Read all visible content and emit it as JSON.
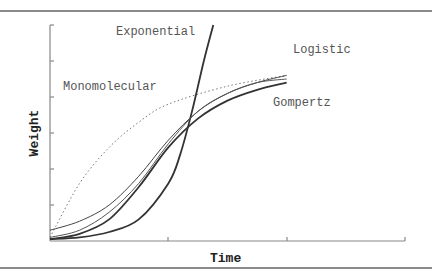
{
  "chart_data": {
    "type": "line",
    "title": "",
    "xlabel": "Time",
    "ylabel": "Weight",
    "grid": false,
    "legend": "inline labels",
    "xlim": [
      0,
      3
    ],
    "ylim": [
      0,
      6
    ],
    "x_ticks": [
      0,
      1,
      2,
      3
    ],
    "y_ticks": [
      0,
      1,
      2,
      3,
      4,
      5,
      6
    ],
    "x_tick_labels": [],
    "y_tick_labels": [],
    "series": [
      {
        "name": "Exponential",
        "style": "solid, thick",
        "x": [
          0,
          0.25,
          0.5,
          0.75,
          1.0,
          1.1,
          1.2,
          1.3,
          1.38
        ],
        "values": [
          0.05,
          0.1,
          0.25,
          0.6,
          1.6,
          2.4,
          3.6,
          5.0,
          6.0
        ]
      },
      {
        "name": "Monomolecular",
        "style": "dotted",
        "x": [
          0,
          0.25,
          0.5,
          0.75,
          1.0,
          1.5,
          2.0
        ],
        "values": [
          0.1,
          1.6,
          2.6,
          3.3,
          3.8,
          4.3,
          4.6
        ]
      },
      {
        "name": "Logistic",
        "style": "solid, thin",
        "x": [
          0,
          0.25,
          0.5,
          0.75,
          1.0,
          1.25,
          1.5,
          1.75,
          2.0
        ],
        "values": [
          0.3,
          0.55,
          1.0,
          1.8,
          2.8,
          3.6,
          4.1,
          4.4,
          4.6
        ]
      },
      {
        "name": "Gompertz",
        "style": "solid, medium",
        "x": [
          0,
          0.25,
          0.5,
          0.75,
          1.0,
          1.25,
          1.5,
          1.75,
          2.0
        ],
        "values": [
          0.05,
          0.2,
          0.6,
          1.5,
          2.6,
          3.4,
          3.9,
          4.2,
          4.4
        ]
      },
      {
        "name": "Richards",
        "style": "solid, thin",
        "x": [
          0,
          0.25,
          0.5,
          0.75,
          1.0,
          1.25,
          1.5,
          1.75,
          2.0
        ],
        "values": [
          0.1,
          0.3,
          0.8,
          1.6,
          2.7,
          3.6,
          4.1,
          4.4,
          4.5
        ]
      }
    ],
    "annotations": [
      "Exponential",
      "Logistic",
      "Monomolecular",
      "Gompertz"
    ]
  },
  "labels": {
    "exponential": "Exponential",
    "logistic": "Logistic",
    "monomolecular": "Monomolecular",
    "gompertz": "Gompertz",
    "xlabel": "Time",
    "ylabel": "Weight"
  }
}
